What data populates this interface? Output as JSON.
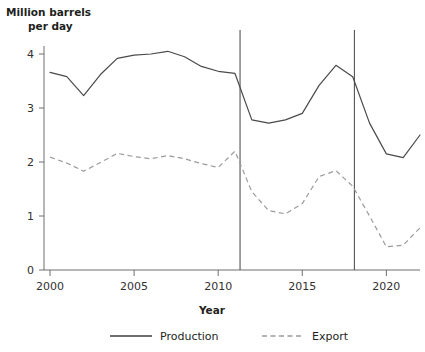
{
  "chart_data": {
    "type": "line",
    "title": "",
    "ylabel": "Million barrels per day",
    "ylabel_line1": "Million barrels",
    "ylabel_line2": "per day",
    "xlabel": "Year",
    "xlim": [
      2000,
      2022
    ],
    "ylim": [
      0,
      4.3
    ],
    "x_ticks": [
      2000,
      2005,
      2010,
      2015,
      2020
    ],
    "x_tick_labels": [
      "2000",
      "2005",
      "2010",
      "2015",
      "2020"
    ],
    "y_ticks": [
      0,
      1,
      2,
      3,
      4
    ],
    "y_tick_labels": [
      "0",
      "1",
      "2",
      "3",
      "4"
    ],
    "grid": false,
    "legend_position": "bottom",
    "x": [
      2000,
      2001,
      2002,
      2003,
      2004,
      2005,
      2006,
      2007,
      2008,
      2009,
      2010,
      2011,
      2012,
      2013,
      2014,
      2015,
      2016,
      2017,
      2018,
      2019,
      2020,
      2021,
      2022
    ],
    "series": [
      {
        "name": "Production",
        "style": "solid",
        "color": "#4a4a4a",
        "values": [
          3.66,
          3.58,
          3.23,
          3.62,
          3.92,
          3.98,
          4.0,
          4.05,
          3.95,
          3.77,
          3.68,
          3.64,
          2.78,
          2.72,
          2.78,
          2.9,
          3.42,
          3.79,
          3.58,
          2.72,
          2.15,
          2.08,
          2.5
        ]
      },
      {
        "name": "Export",
        "style": "dashed",
        "color": "#9b9b9b",
        "values": [
          2.09,
          1.98,
          1.83,
          1.99,
          2.16,
          2.1,
          2.06,
          2.12,
          2.06,
          1.97,
          1.9,
          2.2,
          1.45,
          1.1,
          1.04,
          1.23,
          1.73,
          1.84,
          1.55,
          1.0,
          0.43,
          0.46,
          0.78
        ]
      }
    ],
    "reference_lines": [
      {
        "x": 2011.3,
        "label": ""
      },
      {
        "x": 2018.1,
        "label": ""
      }
    ],
    "legend": [
      {
        "label": "Production",
        "style": "solid"
      },
      {
        "label": "Export",
        "style": "dashed"
      }
    ]
  }
}
